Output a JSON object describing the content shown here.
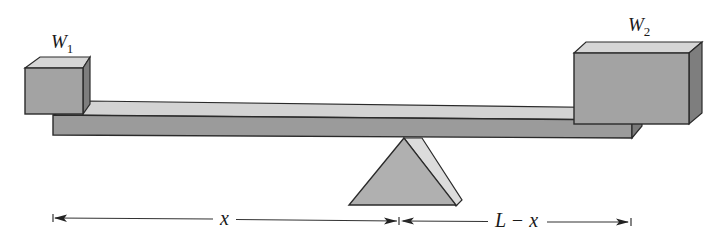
{
  "diagram": {
    "weights": [
      {
        "id": "w1",
        "symbol": "W",
        "subscript": "1"
      },
      {
        "id": "w2",
        "symbol": "W",
        "subscript": "2"
      }
    ],
    "dimensions": {
      "left_label": "x",
      "right_label": "L − x"
    },
    "colors": {
      "box_front": "#a3a3a3",
      "box_top": "#d6d6d6",
      "box_side": "#7e7e7e",
      "beam_top": "#d3d3d3",
      "beam_front": "#9b9b9b",
      "beam_side": "#7a7a7a",
      "fulcrum_front": "#b0b0b0",
      "fulcrum_side": "#dcdcdc",
      "outline": "#2a2a2a"
    }
  }
}
